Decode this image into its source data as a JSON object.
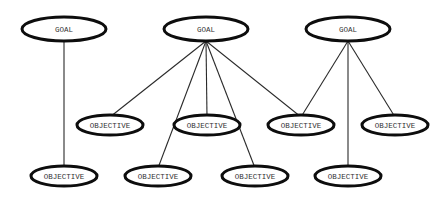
{
  "diagram": {
    "type": "goal-objective hierarchy",
    "colors": {
      "background": "#ffffff",
      "outline": "#0d0d0d",
      "edge": "#2a2a2a",
      "text": "#333333"
    },
    "nodes": [
      {
        "id": "goal_1",
        "kind": "goal",
        "label": "GOAL"
      },
      {
        "id": "goal_2",
        "kind": "goal",
        "label": "GOAL"
      },
      {
        "id": "goal_3",
        "kind": "goal",
        "label": "GOAL"
      },
      {
        "id": "obj_1",
        "kind": "objective",
        "label": "OBJECTIVE"
      },
      {
        "id": "obj_2",
        "kind": "objective",
        "label": "OBJECTIVE"
      },
      {
        "id": "obj_3",
        "kind": "objective",
        "label": "OBJECTIVE"
      },
      {
        "id": "obj_4",
        "kind": "objective",
        "label": "OBJECTIVE"
      },
      {
        "id": "obj_5",
        "kind": "objective",
        "label": "OBJECTIVE"
      },
      {
        "id": "obj_6",
        "kind": "objective",
        "label": "OBJECTIVE"
      },
      {
        "id": "obj_7",
        "kind": "objective",
        "label": "OBJECTIVE"
      },
      {
        "id": "obj_8",
        "kind": "objective",
        "label": "OBJECTIVE"
      }
    ],
    "edges": [
      {
        "from": "goal_1",
        "to": "obj_1"
      },
      {
        "from": "goal_2",
        "to": "obj_2"
      },
      {
        "from": "goal_2",
        "to": "obj_3"
      },
      {
        "from": "goal_2",
        "to": "obj_4"
      },
      {
        "from": "goal_2",
        "to": "obj_5"
      },
      {
        "from": "goal_2",
        "to": "obj_6"
      },
      {
        "from": "goal_3",
        "to": "obj_6"
      },
      {
        "from": "goal_3",
        "to": "obj_7"
      },
      {
        "from": "goal_3",
        "to": "obj_8"
      }
    ]
  }
}
